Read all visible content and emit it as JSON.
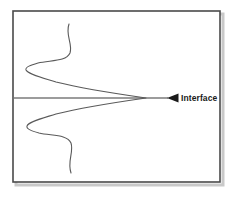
{
  "figure": {
    "title": "",
    "background_color": "#ffffff",
    "frame": {
      "name": "figure-border",
      "x": 13,
      "y": 11,
      "width": 207,
      "height": 171,
      "stroke_color": "#4a4a4a",
      "stroke_width": 1.6,
      "shadow_color": "#b8b8b8"
    },
    "interface_line": {
      "label": "Interface",
      "stroke_color": "#3a3a3a",
      "stroke_width": 1.2,
      "y": 98,
      "x_start": 14,
      "x_end": 167
    },
    "arrow_marker": {
      "name": "interface-arrow",
      "direction": "left",
      "fill_color": "#1a1a1a",
      "tip_x": 167,
      "base_x": 178,
      "y": 98,
      "half_height": 4.2
    },
    "label": {
      "text": "Interface",
      "x": 181,
      "y": 101,
      "color": "#1a1a1a",
      "font_size_px": 8.5,
      "bold": true
    },
    "curve": {
      "name": "concentration-profile-curve",
      "stroke_color": "#5a5a5a",
      "stroke_width": 1.1,
      "description": "Symmetric double-lobed profile converging to a cusp at the interface",
      "cusp_point": [
        146,
        98
      ],
      "upper_tail_end": [
        69,
        24
      ],
      "upper_left_extreme": [
        26,
        68
      ],
      "lower_left_extreme": [
        27,
        127
      ],
      "lower_tail_end": [
        73,
        173
      ],
      "path": "M 69,24 C 65,35 73,44 70,53 C 66,62 50,60 38,63 C 31,65 25,67 26,70 C 28,74 40,77 56,82 C 84,89 125,95 146,98 C 125,101 84,107 56,114 C 40,119 28,122 27,126 C 26,129 32,131 39,133 C 51,136 67,134 71,143 C 74,152 67,161 71,173"
    }
  }
}
